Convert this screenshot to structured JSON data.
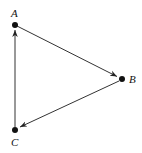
{
  "diagram": {
    "type": "directed-graph",
    "nodes": [
      {
        "id": "A",
        "label": "A",
        "x": 15,
        "y": 25
      },
      {
        "id": "B",
        "label": "B",
        "x": 122,
        "y": 79
      },
      {
        "id": "C",
        "label": "C",
        "x": 15,
        "y": 130
      }
    ],
    "edges": [
      {
        "from": "A",
        "to": "B"
      },
      {
        "from": "B",
        "to": "C"
      },
      {
        "from": "C",
        "to": "A"
      }
    ],
    "colors": {
      "line": "#333333",
      "node": "#111111",
      "background": "#ffffff"
    }
  }
}
